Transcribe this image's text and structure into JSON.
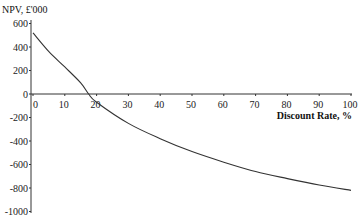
{
  "chart_data": {
    "type": "line",
    "title": "",
    "xlabel": "Discount Rate, %",
    "ylabel": "NPV, £'000",
    "xlim": [
      0,
      100
    ],
    "ylim": [
      -1000,
      600
    ],
    "x_ticks": [
      0,
      10,
      20,
      30,
      40,
      50,
      60,
      70,
      80,
      90,
      100
    ],
    "y_ticks": [
      600,
      400,
      200,
      0,
      -200,
      -400,
      -600,
      -800,
      -1000
    ],
    "grid": false,
    "legend": null,
    "series": [
      {
        "name": "NPV",
        "x": [
          0,
          5,
          10,
          15,
          17.5,
          20,
          30,
          40,
          50,
          60,
          70,
          80,
          90,
          100
        ],
        "values": [
          520,
          360,
          230,
          95,
          0,
          -70,
          -250,
          -380,
          -490,
          -580,
          -660,
          -720,
          -775,
          -820
        ]
      }
    ]
  },
  "labels": {
    "y_title": "NPV, £'000",
    "x_title": "Discount Rate, %"
  }
}
